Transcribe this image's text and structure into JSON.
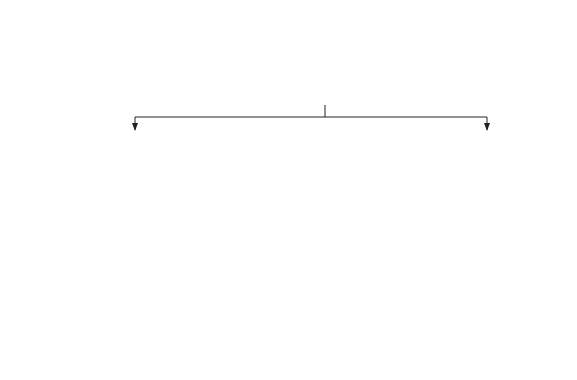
{
  "nodes": {
    "full": {
      "label": "Full consciousness",
      "attrs": [
        "Alert",
        "Oriented",
        "Normal anterograde memory"
      ]
    },
    "clouded": {
      "label": "“Clouded” consciousness",
      "attrs": [
        "Responsive",
        "Confused",
        "Amnesic"
      ]
    },
    "drowsy": {
      "label": "“Drowsy”/“stupor”",
      "attrs": [
        "± Orientation",
        "± Amnesia"
      ]
    },
    "coma": {
      "label": "“Coma”"
    },
    "wakeful": {
      "label": "Wakeful reduced responsiveness"
    }
  },
  "subtypes": [
    {
      "line1": "Vegetative",
      "line2": "state"
    },
    {
      "line1": "Locked",
      "line2": "in"
    },
    {
      "line1": "Aphasia",
      "line2": ""
    },
    {
      "line1": "Akinetic",
      "line2": "mutism"
    }
  ],
  "brain_death": "Brain death",
  "axis": {
    "aware": "Aware",
    "awake": "Awake",
    "sleeplike": "Sleeplike"
  },
  "colors": {
    "ink": "#1a1a1a",
    "background": "#ffffff"
  }
}
